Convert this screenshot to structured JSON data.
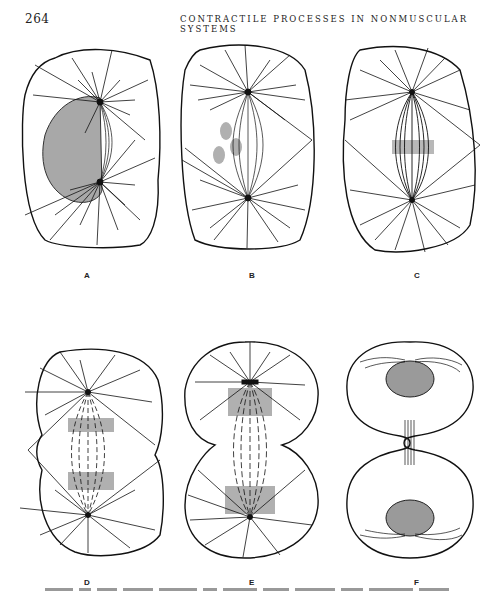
{
  "header": {
    "page_number": "264",
    "running_title": "CONTRACTILE PROCESSES IN NONMUSCULAR SYSTEMS"
  },
  "figure": {
    "panels": [
      {
        "label": "A",
        "stage": "prophase - nucleus with two asters and forming spindle"
      },
      {
        "label": "B",
        "stage": "prometaphase - chromosomes moving onto spindle"
      },
      {
        "label": "C",
        "stage": "metaphase - chromosomes at spindle equator"
      },
      {
        "label": "D",
        "stage": "anaphase - chromosomes separating, cell constricting"
      },
      {
        "label": "E",
        "stage": "late anaphase / telophase - deep cleavage furrow"
      },
      {
        "label": "F",
        "stage": "telophase - two daughter cells with nuclei and midbody"
      }
    ],
    "colors": {
      "ink": "#111111",
      "stipple": "#aaaaaa",
      "nucleus": "#9a9a9a"
    }
  },
  "caption": {
    "visible": "truncated at bottom edge (illegible)"
  }
}
